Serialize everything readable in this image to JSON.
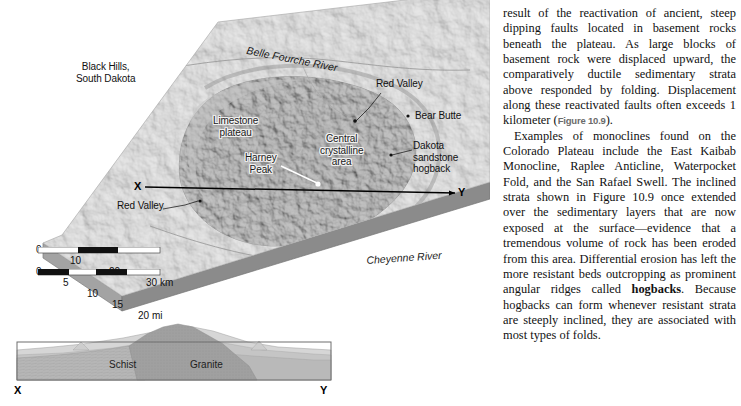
{
  "figure": {
    "map_labels": [
      {
        "name": "black-hills-label",
        "text": "Black Hills,\nSouth Dakota",
        "x": 76,
        "y": 61,
        "style": "plain",
        "align": "center"
      },
      {
        "name": "belle-fourche-river-label",
        "text": "Belle Fourche River",
        "x": 248,
        "y": 47,
        "style": "river"
      },
      {
        "name": "red-valley-upper-label",
        "text": "Red Valley",
        "x": 376,
        "y": 83,
        "style": "plain"
      },
      {
        "name": "bear-butte-label",
        "text": "Bear Butte",
        "x": 415,
        "y": 114,
        "style": "plain"
      },
      {
        "name": "limestone-plateau-label",
        "text": "Limestone\nplateau",
        "x": 213,
        "y": 118,
        "style": "halo",
        "align": "center"
      },
      {
        "name": "central-crystalline-label",
        "text": "Central\ncrystalline\narea",
        "x": 323,
        "y": 135,
        "style": "halo",
        "align": "center"
      },
      {
        "name": "harney-peak-label",
        "text": "Harney\nPeak",
        "x": 258,
        "y": 154,
        "style": "halo",
        "align": "center"
      },
      {
        "name": "dakota-hogback-label",
        "text": "Dakota\nsandstone\nhogback",
        "x": 413,
        "y": 143,
        "style": "plain"
      },
      {
        "name": "red-valley-lower-label",
        "text": "Red Valley",
        "x": 117,
        "y": 203,
        "style": "plain"
      },
      {
        "name": "cheyenne-river-label",
        "text": "Cheyenne River",
        "x": 366,
        "y": 257,
        "style": "river"
      }
    ],
    "section_line": {
      "x_label": "X",
      "y_label": "Y"
    },
    "scale_km": {
      "ticks": [
        "0",
        "10",
        "20",
        "30 km"
      ]
    },
    "scale_mi": {
      "ticks": [
        "0",
        "5",
        "10",
        "15",
        "20 mi"
      ]
    },
    "cross_section": {
      "schist_label": "Schist",
      "granite_label": "Granite",
      "x_label": "X",
      "y_label": "Y"
    },
    "colors": {
      "block_top": "#c9c9c9",
      "block_side": "#8e8e8e",
      "block_front": "#a8a8a8",
      "granite": "#9a9a9a",
      "schist": "#b4b4b4",
      "sediment": "#d2d2d2",
      "label_halo": "#f2f2f2"
    }
  },
  "text_column": {
    "paragraphs": [
      {
        "name": "paragraph-monoclines-faults",
        "indent": false,
        "runs": [
          {
            "type": "text",
            "value": "result of the reactivation of ancient, steep dipping faults located in basement rocks beneath the plateau. As large blocks of basement rock were displaced upward, the comparatively ductile sedimentary strata above responded by folding. Displacement along these reactivated faults often exceeds 1 kilometer ("
          },
          {
            "type": "figref",
            "value": "Figure 10.9"
          },
          {
            "type": "text",
            "value": ")."
          }
        ]
      },
      {
        "name": "paragraph-examples-hogbacks",
        "indent": true,
        "runs": [
          {
            "type": "text",
            "value": "Examples of monoclines found on the Colorado Plateau include the East Kaibab Monocline, Raplee Anticline, Waterpocket Fold, and the San Rafael Swell. The inclined strata shown in Figure 10.9 once extended over the sedimentary layers that are now exposed at the surface—evidence that a tremendous volume of rock has been eroded from this area. Differential erosion has left the more resistant beds outcropping as prominent angular ridges called "
          },
          {
            "type": "bold",
            "value": "hogbacks"
          },
          {
            "type": "text",
            "value": ". Because hogbacks can form whenever resistant strata are steeply inclined, they are associated with most types of folds."
          }
        ]
      }
    ]
  }
}
